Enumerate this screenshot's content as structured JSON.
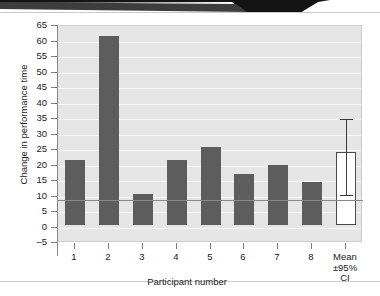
{
  "chart_data": {
    "type": "bar",
    "title": "",
    "xlabel": "Participant number",
    "ylabel": "Change in performance time",
    "categories": [
      "1",
      "2",
      "3",
      "4",
      "5",
      "6",
      "7",
      "8",
      "Mean\n±95%\nCI"
    ],
    "category_labels": [
      {
        "lines": [
          "1"
        ]
      },
      {
        "lines": [
          "2"
        ]
      },
      {
        "lines": [
          "3"
        ]
      },
      {
        "lines": [
          "4"
        ]
      },
      {
        "lines": [
          "5"
        ]
      },
      {
        "lines": [
          "6"
        ]
      },
      {
        "lines": [
          "7"
        ]
      },
      {
        "lines": [
          "8"
        ]
      },
      {
        "lines": [
          "Mean",
          "±95%",
          "CI"
        ]
      }
    ],
    "values": [
      21,
      61,
      10,
      21,
      25,
      16.5,
      19.5,
      14,
      23.5
    ],
    "bar_styles": [
      "filled",
      "filled",
      "filled",
      "filled",
      "filled",
      "filled",
      "filled",
      "filled",
      "hollow"
    ],
    "error_bars": [
      null,
      null,
      null,
      null,
      null,
      null,
      null,
      null,
      {
        "low": 10.5,
        "high": 35
      }
    ],
    "ylim": [
      -5,
      65
    ],
    "yticks": [
      -5,
      0,
      5,
      10,
      15,
      20,
      25,
      30,
      35,
      40,
      45,
      50,
      55,
      60,
      65
    ],
    "ytick_labels": [
      "–5",
      "0",
      "5",
      "10",
      "15",
      "20",
      "25",
      "30",
      "35",
      "40",
      "45",
      "50",
      "55",
      "60",
      "65"
    ],
    "grid": true,
    "grid_color": "#f7f7f7",
    "legend": null,
    "colors": {
      "bar_fill": "#5d5d5d",
      "mean_bar_fill": "#ffffff",
      "mean_bar_border": "#4a4a4a",
      "plot_background": "#e6e6e6",
      "error_bar": "#3a3a3a",
      "axis": "#8a8a8a",
      "text": "#1a1a1a"
    }
  },
  "banner": {
    "color": "#141414"
  }
}
